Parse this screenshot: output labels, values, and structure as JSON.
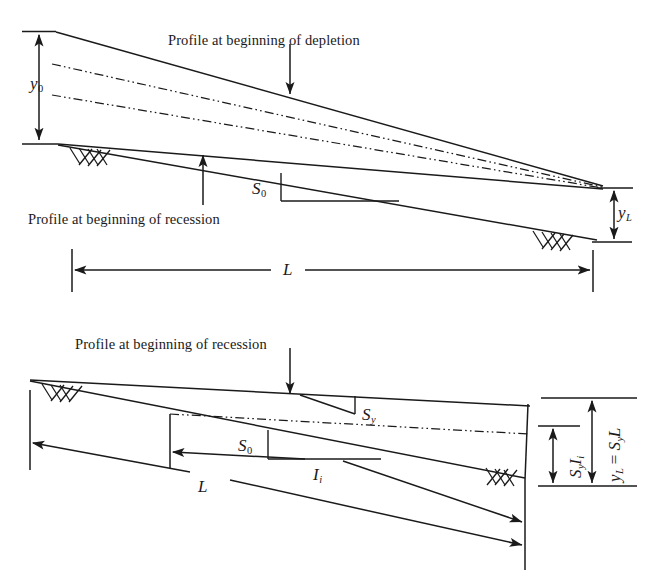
{
  "figure": {
    "background_color": "#ffffff",
    "line_color": "#1a1a1a"
  },
  "top_panel": {
    "captions": [
      {
        "id": "depletion",
        "text": "Profile at beginning of depletion"
      },
      {
        "id": "recession",
        "text": "Profile at beginning of recession"
      }
    ],
    "symbols": {
      "y0": {
        "base": "y",
        "sub": "0"
      },
      "yL": {
        "base": "y",
        "sub": "L"
      },
      "S0": {
        "base": "S",
        "sub": "0"
      },
      "L": {
        "base": "L",
        "sub": ""
      }
    }
  },
  "bottom_panel": {
    "captions": [
      {
        "id": "recession",
        "text": "Profile at beginning of recession"
      }
    ],
    "symbols": {
      "Sy": {
        "base": "S",
        "sub": "y"
      },
      "S0": {
        "base": "S",
        "sub": "0"
      },
      "L": {
        "base": "L",
        "sub": ""
      },
      "Ii": {
        "base": "I",
        "sub": "i"
      },
      "SyIi": {
        "text": "SᵧIᵢ"
      },
      "yL_eq": {
        "text": "yʟ = SᵧL"
      }
    }
  },
  "labels": {
    "y0_text": "y",
    "y0_sub": "0",
    "yL_text": "y",
    "yL_sub": "L",
    "S0_text": "S",
    "S0_sub": "0",
    "Sy_text": "S",
    "Sy_sub": "y",
    "L_text": "L",
    "Ii_text": "I",
    "Ii_sub": "i",
    "SyIi_S": "S",
    "SyIi_y": "y",
    "SyIi_I": "I",
    "SyIi_i": "i",
    "yLeq_y": "y",
    "yLeq_L": "L",
    "yLeq_eq": " = ",
    "yLeq_S": "S",
    "yLeq_sy": "y",
    "yLeq_BigL": "L"
  }
}
